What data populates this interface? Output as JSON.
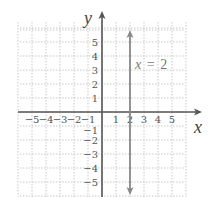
{
  "chart_data": {
    "type": "line",
    "title": "",
    "xlabel": "x",
    "ylabel": "y",
    "xlim": [
      -6,
      6
    ],
    "ylim": [
      -6,
      6
    ],
    "grid": true,
    "x_ticks": [
      "−5",
      "−4",
      "−3",
      "−2",
      "−1",
      "1",
      "2",
      "3",
      "4",
      "5"
    ],
    "y_ticks": [
      "5",
      "4",
      "3",
      "2",
      "1",
      "−1",
      "−2",
      "−3",
      "−4",
      "−5"
    ],
    "series": [
      {
        "name": "x = 2",
        "type": "vertical-line",
        "x": 2,
        "points": [
          [
            2,
            -6
          ],
          [
            2,
            6
          ]
        ],
        "arrows": "both"
      }
    ],
    "annotations": [
      {
        "text": "x = 2",
        "x": 2.3,
        "y": 3.5
      }
    ],
    "colors": {
      "grid": "#bbbbbb",
      "axes": "#555555",
      "line": "#888888"
    }
  },
  "labels": {
    "x_axis": "x",
    "y_axis": "y",
    "equation_x": "x",
    "equation_eq": "=",
    "equation_val": "2"
  }
}
